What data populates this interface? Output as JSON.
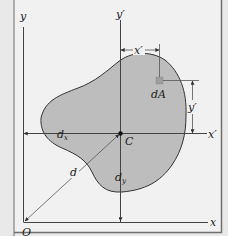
{
  "figure": {
    "colors": {
      "background": "#ececec",
      "panel": "#f1f1f1",
      "shape_fill": "#bdbdbd",
      "outline": "#333333",
      "dA_fill": "#9e9e9e",
      "frame": "#6f6f6f"
    },
    "labels": {
      "y_axis": "y",
      "x_axis": "x",
      "y_prime_axis": "y′",
      "x_prime_axis": "x′",
      "origin": "O",
      "centroid": "C",
      "element": "dA",
      "x_prime_dim": "x′",
      "y_prime_dim": "y′",
      "d_x": "d",
      "d_x_sub": "x",
      "d_y": "d",
      "d_y_sub": "y",
      "d": "d"
    }
  }
}
